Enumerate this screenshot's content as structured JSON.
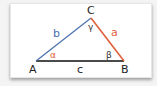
{
  "diagram": {
    "type": "triangle",
    "vertices": {
      "A": {
        "label": "A",
        "x": 36,
        "y": 61
      },
      "B": {
        "label": "B",
        "x": 124,
        "y": 61
      },
      "C": {
        "label": "C",
        "x": 91,
        "y": 18
      }
    },
    "sides": {
      "a": {
        "label": "a",
        "from": "C",
        "to": "B",
        "color": "#e0603a"
      },
      "b": {
        "label": "b",
        "from": "A",
        "to": "C",
        "color": "#4a6fb0"
      },
      "c": {
        "label": "c",
        "from": "A",
        "to": "B",
        "color": "#4a4a4a"
      }
    },
    "angles": {
      "alpha": {
        "label": "α",
        "vertex": "A",
        "color": "#e0603a"
      },
      "beta": {
        "label": "β",
        "vertex": "B",
        "color": "#333333"
      },
      "gamma": {
        "label": "γ",
        "vertex": "C",
        "color": "#333333"
      }
    },
    "colors": {
      "background": "#f4f4f4",
      "card": "#ffffff",
      "text": "#222222"
    }
  }
}
